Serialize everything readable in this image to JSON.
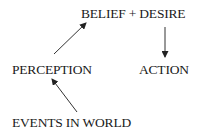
{
  "diagram": {
    "nodes": [
      {
        "id": "belief",
        "label": "BELIEF + DESIRE"
      },
      {
        "id": "perception",
        "label": "PERCEPTION"
      },
      {
        "id": "action",
        "label": "ACTION"
      },
      {
        "id": "events",
        "label": "EVENTS IN WORLD"
      }
    ],
    "edges": [
      {
        "from": "perception",
        "to": "belief"
      },
      {
        "from": "belief",
        "to": "action"
      },
      {
        "from": "events",
        "to": "perception"
      }
    ],
    "colors": {
      "text": "#1a1a1a",
      "arrow": "#333333"
    }
  }
}
